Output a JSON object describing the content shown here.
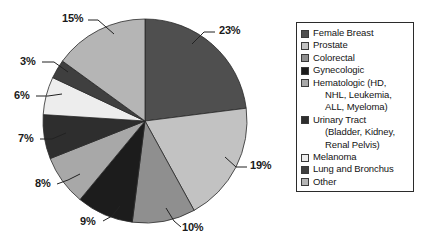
{
  "chart_data": {
    "type": "pie",
    "title": "",
    "subtitle": "",
    "xlabel": "",
    "ylabel": "",
    "legend_position": "right",
    "grid": false,
    "start_angle_deg": 0,
    "direction": "clockwise",
    "categories": [
      "Female Breast",
      "Prostate",
      "Colorectal",
      "Gynecologic",
      "Hematologic (HD, NHL, Leukemia, ALL, Myeloma)",
      "Urinary Tract (Bladder, Kidney, Renal Pelvis)",
      "Melanoma",
      "Lung and Bronchus",
      "Other"
    ],
    "values": [
      23,
      19,
      10,
      9,
      8,
      7,
      6,
      3,
      15
    ],
    "value_labels": [
      "23%",
      "19%",
      "10%",
      "9%",
      "8%",
      "7%",
      "6%",
      "3%",
      "15%"
    ],
    "colors": [
      "#4f4f4f",
      "#c2c2c2",
      "#8f8f8f",
      "#1c1c1c",
      "#a8a8a8",
      "#2e2e2e",
      "#ededed",
      "#3f3f3f",
      "#b5b5b5"
    ],
    "slices": [
      {
        "label": "Female Breast",
        "value": 23,
        "value_label": "23%",
        "color": "#4f4f4f"
      },
      {
        "label": "Prostate",
        "value": 19,
        "value_label": "19%",
        "color": "#c2c2c2"
      },
      {
        "label": "Colorectal",
        "value": 10,
        "value_label": "10%",
        "color": "#8f8f8f"
      },
      {
        "label": "Gynecologic",
        "value": 9,
        "value_label": "9%",
        "color": "#1c1c1c"
      },
      {
        "label": "Hematologic",
        "value": 8,
        "value_label": "8%",
        "color": "#a8a8a8"
      },
      {
        "label": "Urinary Tract",
        "value": 7,
        "value_label": "7%",
        "color": "#2e2e2e"
      },
      {
        "label": "Melanoma",
        "value": 6,
        "value_label": "6%",
        "color": "#ededed"
      },
      {
        "label": "Lung and Bronchus",
        "value": 3,
        "value_label": "3%",
        "color": "#3f3f3f"
      },
      {
        "label": "Other",
        "value": 15,
        "value_label": "15%",
        "color": "#b5b5b5"
      }
    ]
  },
  "legend": {
    "items": [
      {
        "label": "Female Breast",
        "color": "#4f4f4f",
        "continuation": []
      },
      {
        "label": "Prostate",
        "color": "#c2c2c2",
        "continuation": []
      },
      {
        "label": "Colorectal",
        "color": "#8f8f8f",
        "continuation": []
      },
      {
        "label": "Gynecologic",
        "color": "#1c1c1c",
        "continuation": []
      },
      {
        "label": "Hematologic (HD,",
        "color": "#a8a8a8",
        "continuation": [
          "NHL, Leukemia,",
          "ALL, Myeloma)"
        ]
      },
      {
        "label": "Urinary Tract",
        "color": "#2e2e2e",
        "continuation": [
          "(Bladder, Kidney,",
          "Renal Pelvis)"
        ]
      },
      {
        "label": "Melanoma",
        "color": "#ededed",
        "continuation": []
      },
      {
        "label": "Lung and Bronchus",
        "color": "#3f3f3f",
        "continuation": []
      },
      {
        "label": "Other",
        "color": "#b5b5b5",
        "continuation": []
      }
    ]
  },
  "labels": {
    "l23": "23%",
    "l19": "19%",
    "l10": "10%",
    "l9": "9%",
    "l8": "8%",
    "l7": "7%",
    "l6": "6%",
    "l3": "3%",
    "l15": "15%"
  }
}
